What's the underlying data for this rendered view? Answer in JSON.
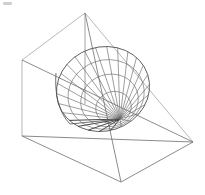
{
  "figure": {
    "kind": "3d-line-drawing",
    "caption": "",
    "background_color": "#ffffff",
    "line_color": "#6d6d6d",
    "accent_line_color": "#2e2e2e",
    "canvas": {
      "width": 205,
      "height": 195
    }
  },
  "chart_data": {
    "type": "scatter",
    "xlabel": "",
    "ylabel": "",
    "xlim": [
      0,
      205
    ],
    "ylim": [
      0,
      195
    ],
    "grid": false,
    "legend": "none",
    "annotations": [
      "cone apex at lower-left of solid",
      "elliptical cone base at upper-right",
      "vertical axis from box top apex down to cone"
    ],
    "box_vertices": {
      "top_apex": [
        85,
        13
      ],
      "left_top": [
        22,
        60
      ],
      "left_bottom": [
        22,
        136
      ],
      "right": [
        193,
        142
      ],
      "bottom": [
        121,
        182
      ],
      "floor_back": [
        85,
        95
      ]
    },
    "box_edges": [
      [
        [
          85,
          13
        ],
        [
          22,
          60
        ]
      ],
      [
        [
          85,
          13
        ],
        [
          193,
          142
        ]
      ],
      [
        [
          22,
          60
        ],
        [
          22,
          136
        ]
      ],
      [
        [
          22,
          136
        ],
        [
          121,
          182
        ]
      ],
      [
        [
          121,
          182
        ],
        [
          193,
          142
        ]
      ],
      [
        [
          22,
          136
        ],
        [
          193,
          142
        ]
      ],
      [
        [
          22,
          60
        ],
        [
          193,
          142
        ]
      ],
      [
        [
          85,
          13
        ],
        [
          121,
          182
        ]
      ]
    ],
    "axis_segment": [
      [
        85,
        13
      ],
      [
        85,
        104
      ]
    ],
    "cone": {
      "apex": [
        120,
        119
      ],
      "base_center": [
        103,
        89
      ],
      "base_rx": 47,
      "base_ry": 42,
      "base_rotation_deg": -18,
      "generatrix_count": 26
    }
  },
  "elements": {
    "box_label": "outer wireframe box",
    "cone_label": "hatched cone surface",
    "axis_label": "vertical axis line"
  }
}
